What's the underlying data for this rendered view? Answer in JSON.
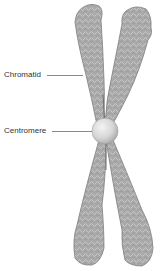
{
  "diagram": {
    "labels": [
      {
        "id": "chromatid",
        "text": "Chromatid"
      },
      {
        "id": "centromere",
        "text": "Centromere"
      }
    ],
    "colors": {
      "chromatid_fill": "#a9a9a9",
      "chromatid_edge": "#7d7d7d",
      "chromatid_texture": "#d2d2d2",
      "centromere_fill": "#d8d8d8",
      "centromere_highlight": "#f2f2f2",
      "leader_line": "#8a8a8a",
      "label_text": "#333333"
    }
  }
}
